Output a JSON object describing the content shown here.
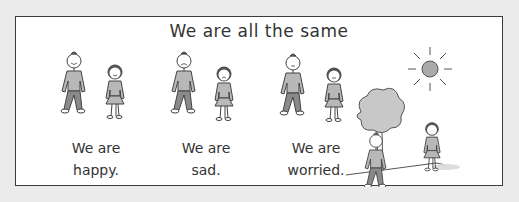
{
  "title": "We are all the same",
  "groups": [
    {
      "line1": "We are",
      "line2": "happy.",
      "mood": "happy"
    },
    {
      "line1": "We are",
      "line2": "sad.",
      "mood": "sad"
    },
    {
      "line1": "We are",
      "line2": "worried.",
      "mood": "worried"
    }
  ],
  "scene": {
    "elements": [
      "sun",
      "tree",
      "boy",
      "girl"
    ]
  },
  "colors": {
    "background": "#ebebeb",
    "frame_border": "#3c3c3c",
    "shirt": "#b8b8b8",
    "pants": "#8a8a8a",
    "text": "#333333"
  }
}
